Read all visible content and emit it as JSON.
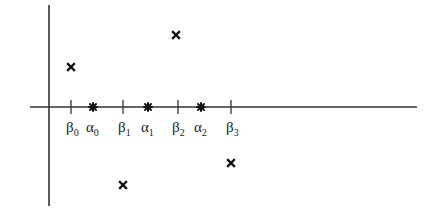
{
  "diagram": {
    "axes": {
      "horizontal": {
        "x1": 30,
        "x2": 417,
        "y": 107
      },
      "vertical": {
        "x": 49,
        "y1": 5,
        "y2": 206
      },
      "color": "#333333"
    },
    "ticks": [
      {
        "x": 71,
        "symbol": "β",
        "sub": "0",
        "kind": "tick"
      },
      {
        "x": 93,
        "symbol": "α",
        "sub": "0",
        "kind": "star"
      },
      {
        "x": 123,
        "symbol": "β",
        "sub": "1",
        "kind": "tick"
      },
      {
        "x": 148,
        "symbol": "α",
        "sub": "1",
        "kind": "star"
      },
      {
        "x": 178,
        "symbol": "β",
        "sub": "2",
        "kind": "tick"
      },
      {
        "x": 201,
        "symbol": "α",
        "sub": "2",
        "kind": "star"
      },
      {
        "x": 231,
        "symbol": "β",
        "sub": "3",
        "kind": "tick"
      }
    ],
    "labels": {
      "b0": "β",
      "b0_sub": "0",
      "a0": "α",
      "a0_sub": "0",
      "b1": "β",
      "b1_sub": "1",
      "a1": "α",
      "a1_sub": "1",
      "b2": "β",
      "b2_sub": "2",
      "a2": "α",
      "a2_sub": "2",
      "b3": "β",
      "b3_sub": "3"
    },
    "points": [
      {
        "x": 71,
        "y": 67,
        "marker": "cross"
      },
      {
        "x": 176,
        "y": 35,
        "marker": "cross"
      },
      {
        "x": 123,
        "y": 185,
        "marker": "cross"
      },
      {
        "x": 231,
        "y": 163,
        "marker": "cross"
      }
    ]
  }
}
